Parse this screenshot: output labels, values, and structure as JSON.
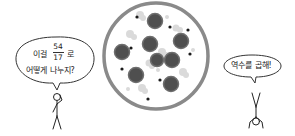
{
  "scene": {
    "type": "comic-illustration",
    "background": "#ffffff"
  },
  "left_character": {
    "pose": "standing-hand-on-head",
    "bubble": {
      "line1_prefix": "이걸",
      "fraction_numerator": "54",
      "fraction_denominator": "17",
      "line1_suffix": "로",
      "line2": "어떻게 나누지?"
    }
  },
  "right_character": {
    "pose": "handstand-upside-down",
    "bubble": {
      "text": "역수를 곱해!"
    }
  },
  "pizza": {
    "crust_color": "#8a8a8a",
    "cheese_color": "#ffffff",
    "pepperoni_color": "#4a4a4a",
    "mushroom_color": "#d9d9d9",
    "olive_color": "#1a1a1a",
    "pepperoni_count": 8
  }
}
